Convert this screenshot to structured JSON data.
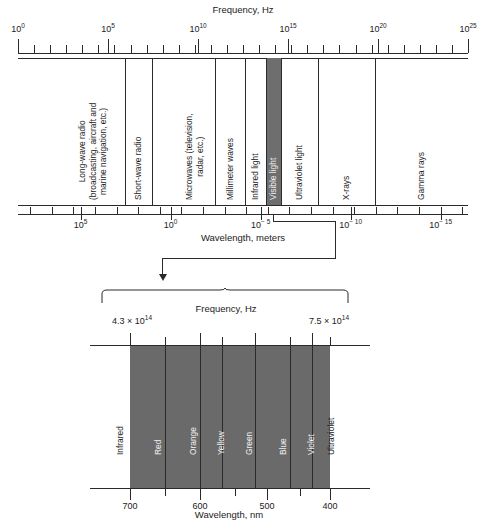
{
  "figure": {
    "kind": "electromagnetic-spectrum-diagram"
  },
  "chart_data": {
    "type": "bar",
    "panels": [
      {
        "name": "full-spectrum",
        "top_axis_label": "Frequency, Hz",
        "bottom_axis_label": "Wavelength, meters",
        "top_tick_labels": [
          "10",
          "10",
          "10",
          "10",
          "10",
          "10"
        ],
        "top_tick_exponents": [
          "0",
          "5",
          "10",
          "15",
          "20",
          "25"
        ],
        "top_tick_decades": [
          0,
          5,
          10,
          15,
          20,
          25
        ],
        "bottom_tick_labels": [
          "10",
          "10",
          "10",
          "10",
          "10"
        ],
        "bottom_tick_exponents": [
          "5",
          "0",
          "− 5",
          "− 10",
          "− 15"
        ],
        "bottom_tick_decades": [
          5,
          0,
          -5,
          -10,
          -15
        ],
        "axis_range_hz": [
          1,
          1e+25
        ],
        "bands": [
          {
            "label": "Long-wave radio\n(broadcasting, aircraft and\nmarine navigation, etc.)",
            "highlight": false
          },
          {
            "label": "Short-wave radio",
            "highlight": false
          },
          {
            "label": "Microwaves (television,\nradar, etc.)",
            "highlight": false
          },
          {
            "label": "Millimeter waves",
            "highlight": false
          },
          {
            "label": "Infrared light",
            "highlight": false
          },
          {
            "label": "Visible light",
            "highlight": true
          },
          {
            "label": "Ultraviolet light",
            "highlight": false
          },
          {
            "label": "X-rays",
            "highlight": false
          },
          {
            "label": "Gamma rays",
            "highlight": false
          }
        ]
      },
      {
        "name": "visible-light-detail",
        "top_axis_label": "Frequency, Hz",
        "bottom_axis_label": "Wavelength, nm",
        "freq_left": "4.3 × 10",
        "freq_left_exp": "14",
        "freq_right": "7.5 × 10",
        "freq_right_exp": "14",
        "wavelength_ticks": [
          "700",
          "600",
          "500",
          "400"
        ],
        "colors": [
          {
            "label": "Infrared",
            "onband": false
          },
          {
            "label": "Red",
            "onband": true
          },
          {
            "label": "Orange",
            "onband": true
          },
          {
            "label": "Yellow",
            "onband": true
          },
          {
            "label": "Green",
            "onband": true
          },
          {
            "label": "Blue",
            "onband": true
          },
          {
            "label": "Violet",
            "onband": true
          },
          {
            "label": "Ultraviolet",
            "onband": false
          }
        ]
      }
    ],
    "colors": {
      "band_fill": "#6e6e6e",
      "rule": "#2a2a2a",
      "text": "#1b1b1b",
      "background": "#ffffff"
    }
  }
}
